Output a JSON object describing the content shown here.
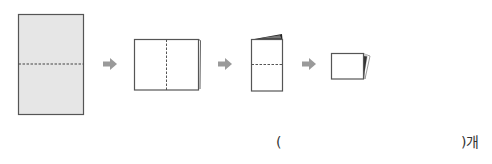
{
  "diagram": {
    "steps": [
      {
        "name": "unfolded-paper",
        "fill": "#e6e6e6",
        "fold_line": "horizontal"
      },
      {
        "name": "folded-once",
        "fill": "#ffffff",
        "fold_line": "vertical"
      },
      {
        "name": "folded-twice",
        "fill": "#ffffff",
        "fold_line": "horizontal"
      },
      {
        "name": "folded-thrice",
        "fill": "#ffffff",
        "fold_line": "none"
      }
    ],
    "arrow_color": "#9a9a9a",
    "outline_color": "#555555"
  },
  "answer": {
    "open": "(",
    "close": ")개"
  }
}
